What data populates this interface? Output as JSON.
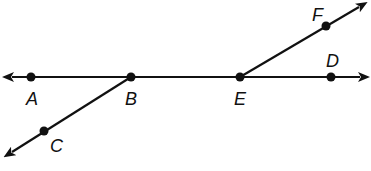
{
  "diagram": {
    "type": "geometry-lines-and-rays",
    "colors": {
      "stroke": "#111111",
      "background": "#ffffff"
    },
    "points": [
      {
        "name": "A",
        "x": 31,
        "y": 77,
        "label_x": 26,
        "label_y": 105
      },
      {
        "name": "B",
        "x": 131,
        "y": 77,
        "label_x": 125,
        "label_y": 105
      },
      {
        "name": "E",
        "x": 240,
        "y": 77,
        "label_x": 234,
        "label_y": 105
      },
      {
        "name": "D",
        "x": 331,
        "y": 77,
        "label_x": 326,
        "label_y": 67
      },
      {
        "name": "F",
        "x": 326,
        "y": 26,
        "label_x": 312,
        "label_y": 21
      },
      {
        "name": "C",
        "x": 44,
        "y": 131,
        "label_x": 50,
        "label_y": 152
      }
    ],
    "lines": [
      {
        "name": "line-AD",
        "description": "Line through A, B, E, D",
        "x1": 12,
        "y1": 77,
        "x2": 360,
        "y2": 77,
        "arrow_start": true,
        "arrow_end": true
      },
      {
        "name": "ray-BC",
        "description": "Ray from B through C",
        "x1": 131,
        "y1": 77,
        "x2": 12,
        "y2": 152,
        "arrow_start": false,
        "arrow_end": true
      },
      {
        "name": "ray-EF",
        "description": "Ray from E through F",
        "x1": 240,
        "y1": 77,
        "x2": 359,
        "y2": 7,
        "arrow_start": false,
        "arrow_end": true
      }
    ]
  }
}
